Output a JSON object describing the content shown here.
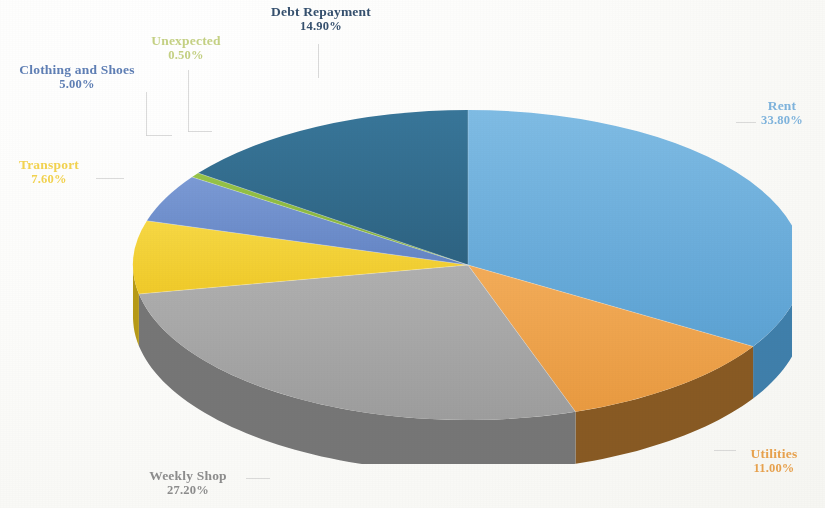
{
  "chart_data": {
    "type": "pie",
    "title": "",
    "subtitle": "",
    "xlabel": "",
    "ylabel": "",
    "legend_position": "none",
    "grid": false,
    "style": "3d-exploded-none",
    "value_suffix": "%",
    "categories": [
      "Rent",
      "Utilities",
      "Weekly Shop",
      "Transport",
      "Clothing and Shoes",
      "Unexpected",
      "Debt Repayment"
    ],
    "values": [
      33.8,
      11.0,
      27.2,
      7.6,
      5.0,
      0.5,
      14.9
    ],
    "labels": [
      "33.80%",
      "11.00%",
      "27.20%",
      "7.60%",
      "5.00%",
      "0.50%",
      "14.90%"
    ],
    "colors": [
      "#5fa8dc",
      "#f0a146",
      "#a6a6a6",
      "#f5d12e",
      "#6b8ed0",
      "#8aba3c",
      "#2e6a8e"
    ],
    "side_colors": [
      "#3d7fad",
      "#8a5a20",
      "#767676",
      "#b89a12",
      "#4a66a0",
      "#5f8a24",
      "#1f4a64"
    ]
  },
  "slices": [
    {
      "name": "Rent",
      "percent_label": "33.80%",
      "color": "#5fa8dc",
      "side": "#3d7fad"
    },
    {
      "name": "Utilities",
      "percent_label": "11.00%",
      "color": "#f0a146",
      "side": "#8a5a20"
    },
    {
      "name": "Weekly Shop",
      "percent_label": "27.20%",
      "color": "#a6a6a6",
      "side": "#767676"
    },
    {
      "name": "Transport",
      "percent_label": "7.60%",
      "color": "#f5d12e",
      "side": "#b89a12"
    },
    {
      "name": "Clothing and Shoes",
      "percent_label": "5.00%",
      "color": "#6b8ed0",
      "side": "#4a66a0"
    },
    {
      "name": "Unexpected",
      "percent_label": "0.50%",
      "color": "#8aba3c",
      "side": "#5f8a24"
    },
    {
      "name": "Debt Repayment",
      "percent_label": "14.90%",
      "color": "#2e6a8e",
      "side": "#1f4a64"
    }
  ]
}
